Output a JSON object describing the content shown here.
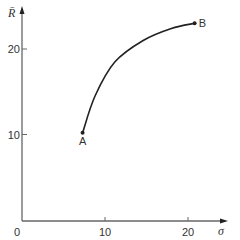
{
  "chart_data": {
    "type": "line",
    "title": "",
    "xlabel": "σ",
    "ylabel": "R̄",
    "xlim": [
      0,
      24
    ],
    "ylim": [
      0,
      25
    ],
    "x_ticks": [
      {
        "value": 0,
        "label": "0"
      },
      {
        "value": 10,
        "label": "10"
      },
      {
        "value": 20,
        "label": "20"
      }
    ],
    "y_ticks": [
      {
        "value": 10,
        "label": "10"
      },
      {
        "value": 20,
        "label": "20"
      }
    ],
    "grid": false,
    "series": [
      {
        "name": "curve A-B",
        "color": "#222222",
        "points": [
          {
            "x": 7.3,
            "y": 10.2
          },
          {
            "x": 8.8,
            "y": 14.5
          },
          {
            "x": 11.2,
            "y": 18.5
          },
          {
            "x": 14.6,
            "y": 21.0
          },
          {
            "x": 18.0,
            "y": 22.4
          },
          {
            "x": 20.8,
            "y": 23.0
          }
        ]
      }
    ],
    "annotations": [
      {
        "label": "A",
        "x": 7.3,
        "y": 10.2,
        "position": "below"
      },
      {
        "label": "B",
        "x": 20.8,
        "y": 23.0,
        "position": "right"
      }
    ]
  }
}
